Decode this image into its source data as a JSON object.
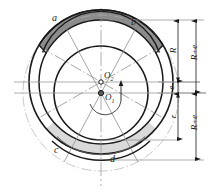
{
  "figure": {
    "type": "engineering-geometry-diagram"
  },
  "point_labels": {
    "a": "a",
    "b": "b",
    "c": "c",
    "d": "d"
  },
  "center_labels": {
    "o1": "O",
    "o1_sub": "1",
    "o2": "O",
    "o2_sub": "2"
  },
  "dimensions": [
    {
      "name": "R",
      "label": "R"
    },
    {
      "name": "R+e",
      "label": "R+e"
    },
    {
      "name": "e",
      "label": "e"
    },
    {
      "name": "r",
      "label": "r"
    },
    {
      "name": "R+e_lower",
      "label": "R+e"
    }
  ],
  "colors": {
    "sector_top_fill": "#8c8c8c",
    "sector_bottom_fill": "#d9d9d9",
    "stroke_dark": "#1a1a1a",
    "stroke_light": "#b3b3b3",
    "stroke_mid": "#808080",
    "background": "#ffffff"
  },
  "geometry": {
    "o1": {
      "x": 101,
      "y": 93
    },
    "o2": {
      "x": 101,
      "y": 82
    },
    "circles": [
      {
        "name": "outer-dashed-circle",
        "center": "o1",
        "radius": 78,
        "style": "thin-light"
      },
      {
        "name": "outer-solid-circle",
        "center": "o2",
        "radius": 72,
        "style": "thick-dark"
      },
      {
        "name": "mid-circle",
        "center": "o2",
        "radius": 62,
        "style": "thick-dark"
      },
      {
        "name": "inner-circle",
        "center": "o1",
        "radius": 47,
        "style": "thick-dark"
      }
    ]
  }
}
